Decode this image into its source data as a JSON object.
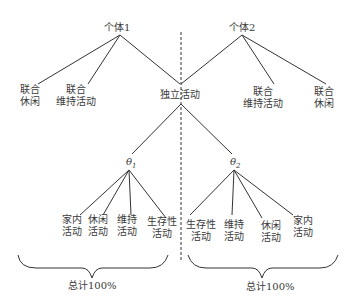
{
  "individual1": {
    "label": "个体1"
  },
  "individual2": {
    "label": "个体2"
  },
  "left_branch": {
    "joint_leisure": "联合\n休闲",
    "joint_maintenance": "联合\n维持活动"
  },
  "right_branch": {
    "joint_maintenance": "联合\n维持活动",
    "joint_leisure": "联合\n休闲"
  },
  "independent": {
    "label": "独立活动"
  },
  "theta1": {
    "symbol": "θ",
    "sub": "1"
  },
  "theta2": {
    "symbol": "θ",
    "sub": "2"
  },
  "theta1_children": [
    "家内\n活动",
    "休闲\n活动",
    "维持\n活动",
    "生存性\n活动"
  ],
  "theta2_children": [
    "生存性\n活动",
    "维持\n活动",
    "休闲\n活动",
    "家内\n活动"
  ],
  "totals": {
    "left": "总计100%",
    "right": "总计100%"
  },
  "colors": {
    "line": "#333333",
    "text": "#3a3a3a"
  }
}
